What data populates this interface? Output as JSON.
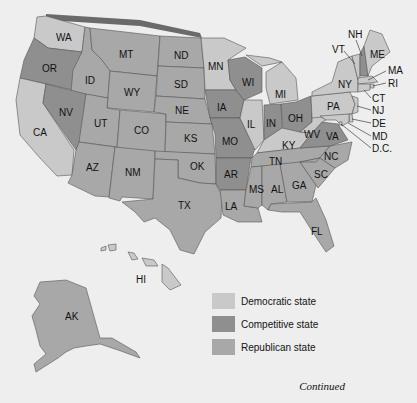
{
  "colors": {
    "democratic": "#c9c9c9",
    "competitive": "#8f8f8f",
    "republican": "#a8a8a8",
    "background": "#eeeeee",
    "border": "#555555",
    "coast_shadow": "#6a6a6a"
  },
  "states": {
    "WA": {
      "label": "WA",
      "category": "democratic"
    },
    "OR": {
      "label": "OR",
      "category": "competitive"
    },
    "CA": {
      "label": "CA",
      "category": "democratic"
    },
    "ID": {
      "label": "ID",
      "category": "republican"
    },
    "NV": {
      "label": "NV",
      "category": "competitive"
    },
    "MT": {
      "label": "MT",
      "category": "republican"
    },
    "WY": {
      "label": "WY",
      "category": "republican"
    },
    "UT": {
      "label": "UT",
      "category": "republican"
    },
    "AZ": {
      "label": "AZ",
      "category": "republican"
    },
    "CO": {
      "label": "CO",
      "category": "republican"
    },
    "NM": {
      "label": "NM",
      "category": "republican"
    },
    "ND": {
      "label": "ND",
      "category": "republican"
    },
    "SD": {
      "label": "SD",
      "category": "republican"
    },
    "NE": {
      "label": "NE",
      "category": "republican"
    },
    "KS": {
      "label": "KS",
      "category": "republican"
    },
    "OK": {
      "label": "OK",
      "category": "republican"
    },
    "TX": {
      "label": "TX",
      "category": "republican"
    },
    "MN": {
      "label": "MN",
      "category": "democratic"
    },
    "IA": {
      "label": "IA",
      "category": "competitive"
    },
    "MO": {
      "label": "MO",
      "category": "competitive"
    },
    "AR": {
      "label": "AR",
      "category": "competitive"
    },
    "LA": {
      "label": "LA",
      "category": "republican"
    },
    "WI": {
      "label": "WI",
      "category": "competitive"
    },
    "IL": {
      "label": "IL",
      "category": "democratic"
    },
    "MI": {
      "label": "MI",
      "category": "democratic"
    },
    "IN": {
      "label": "IN",
      "category": "competitive"
    },
    "OH": {
      "label": "OH",
      "category": "competitive"
    },
    "KY": {
      "label": "KY",
      "category": "democratic"
    },
    "TN": {
      "label": "TN",
      "category": "republican"
    },
    "MS": {
      "label": "MS",
      "category": "republican"
    },
    "AL": {
      "label": "AL",
      "category": "republican"
    },
    "GA": {
      "label": "GA",
      "category": "republican"
    },
    "FL": {
      "label": "FL",
      "category": "republican"
    },
    "SC": {
      "label": "SC",
      "category": "republican"
    },
    "NC": {
      "label": "NC",
      "category": "republican"
    },
    "VA": {
      "label": "VA",
      "category": "competitive"
    },
    "WV": {
      "label": "WV",
      "category": "democratic"
    },
    "PA": {
      "label": "PA",
      "category": "democratic"
    },
    "NY": {
      "label": "NY",
      "category": "democratic"
    },
    "VT": {
      "label": "VT",
      "category": "democratic"
    },
    "NH": {
      "label": "NH",
      "category": "competitive"
    },
    "ME": {
      "label": "ME",
      "category": "democratic"
    },
    "MA": {
      "label": "MA",
      "category": "democratic"
    },
    "RI": {
      "label": "RI",
      "category": "democratic"
    },
    "CT": {
      "label": "CT",
      "category": "democratic"
    },
    "NJ": {
      "label": "NJ",
      "category": "democratic"
    },
    "DE": {
      "label": "DE",
      "category": "democratic"
    },
    "MD": {
      "label": "MD",
      "category": "democratic"
    },
    "DC": {
      "label": "D.C.",
      "category": "democratic"
    },
    "AK": {
      "label": "AK",
      "category": "republican"
    },
    "HI": {
      "label": "HI",
      "category": "democratic"
    }
  },
  "legend": {
    "items": [
      {
        "label": "Democratic state",
        "category": "democratic"
      },
      {
        "label": "Competitive state",
        "category": "competitive"
      },
      {
        "label": "Republican state",
        "category": "republican"
      }
    ]
  },
  "footer": {
    "continued": "Continued"
  }
}
